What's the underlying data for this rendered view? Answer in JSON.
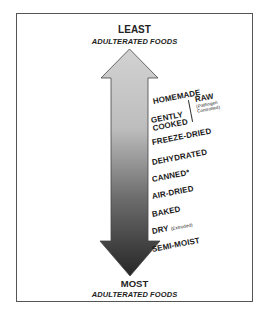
{
  "top": {
    "title": "LEAST",
    "subtitle": "ADULTERATED FOODS"
  },
  "bottom": {
    "title": "MOST",
    "subtitle": "ADULTERATED FOODS"
  },
  "arrow": {
    "direction": "bidirectional-vertical",
    "gradient_top": "#cfcfcf",
    "gradient_bottom": "#2b2b2b"
  },
  "labels": {
    "homemade": "HOMEMADE",
    "gently_1": "GENTLY",
    "gently_2": "COOKED",
    "raw": "RAW",
    "raw_note_1": "(Pathogen",
    "raw_note_2": "Controlled)",
    "freeze_dried": "FREEZE-DRIED",
    "dehydrated": "DEHYDRATED",
    "canned": "CANNED*",
    "air_dried": "AIR-DRIED",
    "baked": "BAKED",
    "dry": "DRY",
    "dry_note": "(Extruded)",
    "semi_moist": "SEMI-MOIST"
  }
}
